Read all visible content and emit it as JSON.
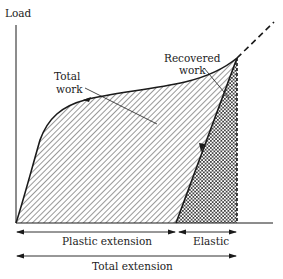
{
  "diagram": {
    "type": "load-extension curve",
    "axes": {
      "y_label": "Load",
      "x_label": ""
    },
    "regions": {
      "total_work": {
        "label_line1": "Total",
        "label_line2": "work",
        "pattern": "diagonal-hatch"
      },
      "recovered_work": {
        "label_line1": "Recovered",
        "label_line2": "work",
        "pattern": "cross-hatch"
      }
    },
    "dimensions": {
      "plastic": "Plastic extension",
      "elastic": "Elastic",
      "total": "Total extension"
    },
    "colors": {
      "line": "#1a1a1a",
      "background": "#ffffff"
    }
  }
}
